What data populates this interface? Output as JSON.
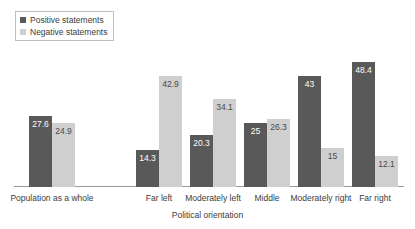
{
  "chart_data": {
    "type": "bar",
    "title": "",
    "xlabel": "Political orientation",
    "ylabel": "",
    "ylim": [
      0,
      50
    ],
    "grid": false,
    "legend_position": "top-left",
    "categories": [
      "Population as a whole",
      "Far left",
      "Moderately left",
      "Middle",
      "Moderately right",
      "Far right"
    ],
    "series": [
      {
        "name": "Positive statements",
        "color": "#595959",
        "values": [
          27.6,
          14.3,
          20.3,
          25,
          43,
          48.4
        ],
        "labels": [
          "27.6",
          "14.3",
          "20.3",
          "25",
          "43",
          "48.4"
        ]
      },
      {
        "name": "Negative statements",
        "color": "#cfcfcf",
        "values": [
          24.9,
          42.9,
          34.1,
          26.3,
          15,
          12.1
        ],
        "labels": [
          "24.9",
          "42.9",
          "34.1",
          "26.3",
          "15",
          "12.1"
        ]
      }
    ]
  },
  "legend": {
    "items": [
      {
        "label": "Positive statements",
        "swatch": "#595959"
      },
      {
        "label": "Negative statements",
        "swatch": "#cfcfcf"
      }
    ]
  },
  "axis": {
    "title": "Political orientation"
  }
}
